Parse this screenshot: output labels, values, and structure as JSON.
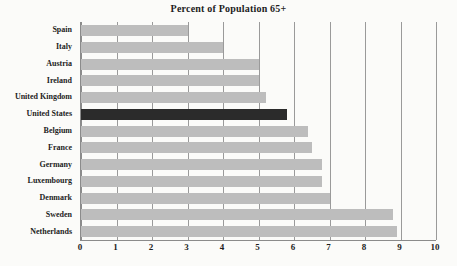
{
  "chart_data": {
    "type": "bar",
    "orientation": "horizontal",
    "title": "Percent of Population 65+",
    "xlabel": "",
    "ylabel": "",
    "xlim": [
      0,
      10
    ],
    "xticks": [
      0,
      1,
      2,
      3,
      4,
      5,
      6,
      7,
      8,
      9,
      10
    ],
    "xtick_labels": [
      "0",
      "1",
      "2",
      "3",
      "4",
      "5",
      "6",
      "7",
      "8",
      "9",
      "10"
    ],
    "grid": "vertical",
    "legend": "none",
    "categories": [
      "Spain",
      "Italy",
      "Austria",
      "Ireland",
      "United Kingdom",
      "United States",
      "Belgium",
      "France",
      "Germany",
      "Luxembourg",
      "Denmark",
      "Sweden",
      "Netherlands"
    ],
    "values": [
      3.0,
      4.0,
      5.0,
      5.0,
      5.2,
      5.8,
      6.4,
      6.5,
      6.8,
      6.8,
      7.0,
      8.8,
      8.9
    ],
    "highlight_category": "United States",
    "colors": {
      "bar": "#bdbdbd",
      "bar_highlight": "#2b2b2b",
      "grid": "#9a9a9a",
      "axis": "#8b8b8b",
      "background": "#fbfbf9",
      "text": "#1d1d1d"
    }
  }
}
